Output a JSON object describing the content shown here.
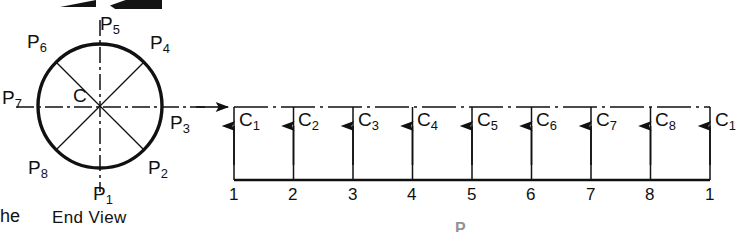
{
  "figure": {
    "type": "engineering-drawing",
    "stroke_color": "#111111",
    "background_color": "#ffffff"
  },
  "end_view": {
    "caption": "End View",
    "center_label": "C",
    "circle": {
      "cx": 100,
      "cy": 106,
      "r": 62
    },
    "points": [
      {
        "id": "P1",
        "base": "P",
        "sub": "1",
        "angle_deg": 270,
        "label_x": 92,
        "label_y": 183
      },
      {
        "id": "P2",
        "base": "P",
        "sub": "2",
        "angle_deg": 315,
        "label_x": 150,
        "label_y": 160
      },
      {
        "id": "P3",
        "base": "P",
        "sub": "3",
        "angle_deg": 0,
        "label_x": 166,
        "label_y": 112
      },
      {
        "id": "P4",
        "base": "P",
        "sub": "4",
        "angle_deg": 45,
        "label_x": 150,
        "label_y": 33
      },
      {
        "id": "P5",
        "base": "P",
        "sub": "5",
        "angle_deg": 90,
        "label_x": 100,
        "label_y": 14
      },
      {
        "id": "P6",
        "base": "P",
        "sub": "6",
        "angle_deg": 135,
        "label_x": 27,
        "label_y": 32
      },
      {
        "id": "P7",
        "base": "P",
        "sub": "7",
        "angle_deg": 180,
        "label_x": 3,
        "label_y": 88
      },
      {
        "id": "P8",
        "base": "P",
        "sub": "8",
        "angle_deg": 225,
        "label_x": 27,
        "label_y": 160
      }
    ]
  },
  "development": {
    "top_line_style": "dash-dot-centerline",
    "baseline_y": 180,
    "top_y": 107,
    "left_x": 234,
    "right_x": 710,
    "divisions": 8,
    "element_labels": [
      {
        "base": "C",
        "sub": "1"
      },
      {
        "base": "C",
        "sub": "2"
      },
      {
        "base": "C",
        "sub": "3"
      },
      {
        "base": "C",
        "sub": "4"
      },
      {
        "base": "C",
        "sub": "5"
      },
      {
        "base": "C",
        "sub": "6"
      },
      {
        "base": "C",
        "sub": "7"
      },
      {
        "base": "C",
        "sub": "8"
      },
      {
        "base": "C",
        "sub": "1"
      }
    ],
    "baseline_numbers": [
      "1",
      "2",
      "3",
      "4",
      "5",
      "6",
      "7",
      "8",
      "1"
    ],
    "projector_arrow_direction": "up"
  },
  "projection": {
    "arrow_direction": "right",
    "arrow_tip_x": 228,
    "arrow_y": 107
  },
  "page_fragments": {
    "left_word_fragment": "he",
    "bottom_letter_fragment": "P",
    "top_artifact": "cropped-dark-shape"
  }
}
